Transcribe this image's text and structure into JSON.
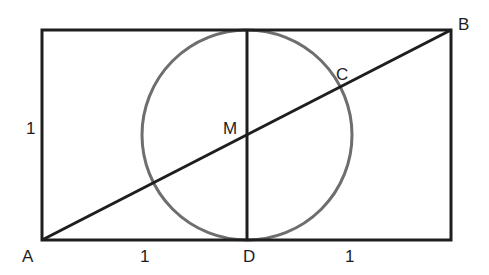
{
  "diagram": {
    "type": "geometry",
    "colors": {
      "background": "#ffffff",
      "lines": "#1e1e1e",
      "circle": "#6e6e6e"
    },
    "points": {
      "A": {
        "label": "A"
      },
      "B": {
        "label": "B"
      },
      "C": {
        "label": "C"
      },
      "D": {
        "label": "D"
      },
      "M": {
        "label": "M"
      }
    },
    "measures": {
      "left_side": "1",
      "bottom_left": "1",
      "bottom_right": "1"
    }
  }
}
